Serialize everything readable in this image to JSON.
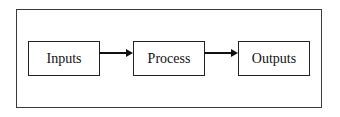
{
  "diagram": {
    "type": "flowchart",
    "nodes": [
      {
        "id": "inputs",
        "label": "Inputs"
      },
      {
        "id": "process",
        "label": "Process"
      },
      {
        "id": "outputs",
        "label": "Outputs"
      }
    ],
    "edges": [
      {
        "from": "inputs",
        "to": "process"
      },
      {
        "from": "process",
        "to": "outputs"
      }
    ],
    "colors": {
      "stroke": "#222222",
      "frame": "#3a3a3a",
      "background": "#ffffff"
    }
  }
}
